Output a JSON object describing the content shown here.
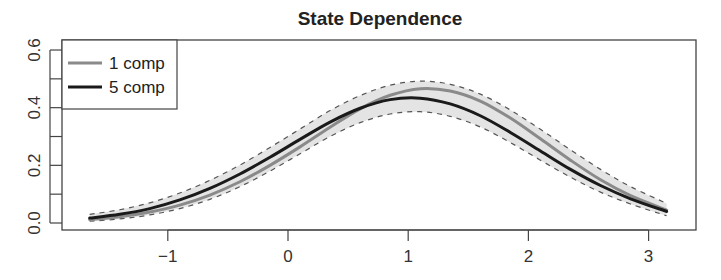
{
  "chart_data": {
    "type": "line",
    "title": "State Dependence",
    "xlabel": "",
    "ylabel": "",
    "xlim": [
      -1.75,
      3.35
    ],
    "ylim": [
      0.0,
      0.6
    ],
    "x_ticks": [
      -1,
      0,
      1,
      2,
      3
    ],
    "x_tick_labels": [
      "−1",
      "0",
      "1",
      "2",
      "3"
    ],
    "y_ticks": [
      0.0,
      0.1,
      0.2,
      0.3,
      0.4,
      0.5,
      0.6
    ],
    "y_tick_labels": [
      "0.0",
      "",
      "0.2",
      "",
      "0.4",
      "",
      "0.6"
    ],
    "grid": false,
    "legend_position": "top-left",
    "x": [
      -1.65,
      -1.4,
      -1.15,
      -0.9,
      -0.65,
      -0.4,
      -0.15,
      0.1,
      0.35,
      0.6,
      0.85,
      1.1,
      1.35,
      1.6,
      1.85,
      2.1,
      2.35,
      2.6,
      2.85,
      3.15
    ],
    "series": [
      {
        "name": "1 comp",
        "color": "#8a8a8a",
        "values": [
          0.012,
          0.022,
          0.038,
          0.062,
          0.097,
          0.143,
          0.2,
          0.264,
          0.332,
          0.396,
          0.443,
          0.466,
          0.458,
          0.423,
          0.364,
          0.292,
          0.218,
          0.15,
          0.095,
          0.045
        ]
      },
      {
        "name": "5 comp",
        "color": "#1a1a1a",
        "values": [
          0.017,
          0.03,
          0.05,
          0.08,
          0.12,
          0.17,
          0.228,
          0.29,
          0.35,
          0.398,
          0.428,
          0.433,
          0.413,
          0.372,
          0.314,
          0.25,
          0.186,
          0.13,
          0.084,
          0.04
        ]
      }
    ],
    "band": {
      "name": "interval",
      "fill": "#e4e4e4",
      "upper": [
        0.03,
        0.046,
        0.07,
        0.104,
        0.148,
        0.201,
        0.262,
        0.326,
        0.39,
        0.442,
        0.478,
        0.492,
        0.481,
        0.447,
        0.392,
        0.325,
        0.254,
        0.186,
        0.126,
        0.068
      ],
      "lower": [
        0.006,
        0.014,
        0.028,
        0.05,
        0.082,
        0.126,
        0.18,
        0.24,
        0.3,
        0.348,
        0.378,
        0.386,
        0.37,
        0.333,
        0.279,
        0.218,
        0.159,
        0.107,
        0.066,
        0.025
      ]
    }
  }
}
